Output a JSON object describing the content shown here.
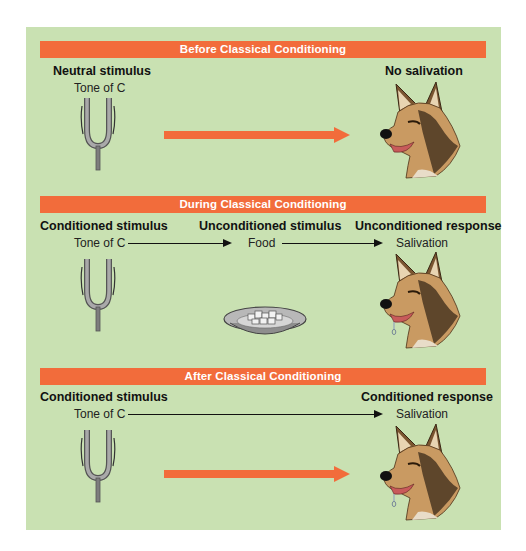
{
  "colors": {
    "panel": "#c9e1b2",
    "bar": "#f26c3b",
    "arrow": "#f26c3b",
    "text": "#111111"
  },
  "sections": [
    {
      "title": "Before Classical Conditioning",
      "left_label": "Neutral stimulus",
      "left_sub": "Tone of C",
      "right_label": "No salivation",
      "icons": [
        "tuning-fork-icon",
        "orange-arrow",
        "dog-head-icon"
      ]
    },
    {
      "title": "During Classical Conditioning",
      "left_label": "Conditioned stimulus",
      "left_sub": "Tone of C",
      "mid_label": "Unconditioned stimulus",
      "mid_sub": "Food",
      "right_label": "Unconditioned response",
      "right_sub": "Salivation",
      "icons": [
        "tuning-fork-icon",
        "food-bowl-icon",
        "salivating-dog-head-icon"
      ]
    },
    {
      "title": "After Classical Conditioning",
      "left_label": "Conditioned stimulus",
      "left_sub": "Tone of C",
      "right_label": "Conditioned response",
      "right_sub": "Salivation",
      "icons": [
        "tuning-fork-icon",
        "orange-arrow",
        "salivating-dog-head-icon"
      ]
    }
  ]
}
